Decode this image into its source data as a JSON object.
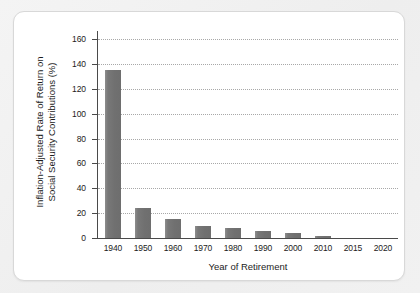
{
  "chart_data": {
    "type": "bar",
    "title": "",
    "xlabel": "Year of Retirement",
    "ylabel_line1": "Inflation-Adjusted Rate of Return on",
    "ylabel_line2": "Social Security Contributions (%)",
    "ylabel": "Inflation-Adjusted Rate of Return on Social Security Contributions (%)",
    "categories": [
      "1940",
      "1950",
      "1960",
      "1970",
      "1980",
      "1990",
      "2000",
      "2010",
      "2015",
      "2020"
    ],
    "values": [
      135,
      24,
      15,
      10,
      8,
      6,
      4,
      1.5,
      0,
      0
    ],
    "yticks": [
      "0",
      "20",
      "40",
      "60",
      "80",
      "100",
      "120",
      "140",
      "160"
    ],
    "ytick_values": [
      0,
      20,
      40,
      60,
      80,
      100,
      120,
      140,
      160
    ],
    "ylim": [
      0,
      160
    ],
    "grid": true,
    "grid_style": "dotted",
    "legend": "none",
    "bar_color": "#757575",
    "axis_color": "#4a4a4a",
    "grid_color": "#9a9a9a",
    "panel_background": "#ffffff",
    "figure_background": "#f1f1f1"
  }
}
